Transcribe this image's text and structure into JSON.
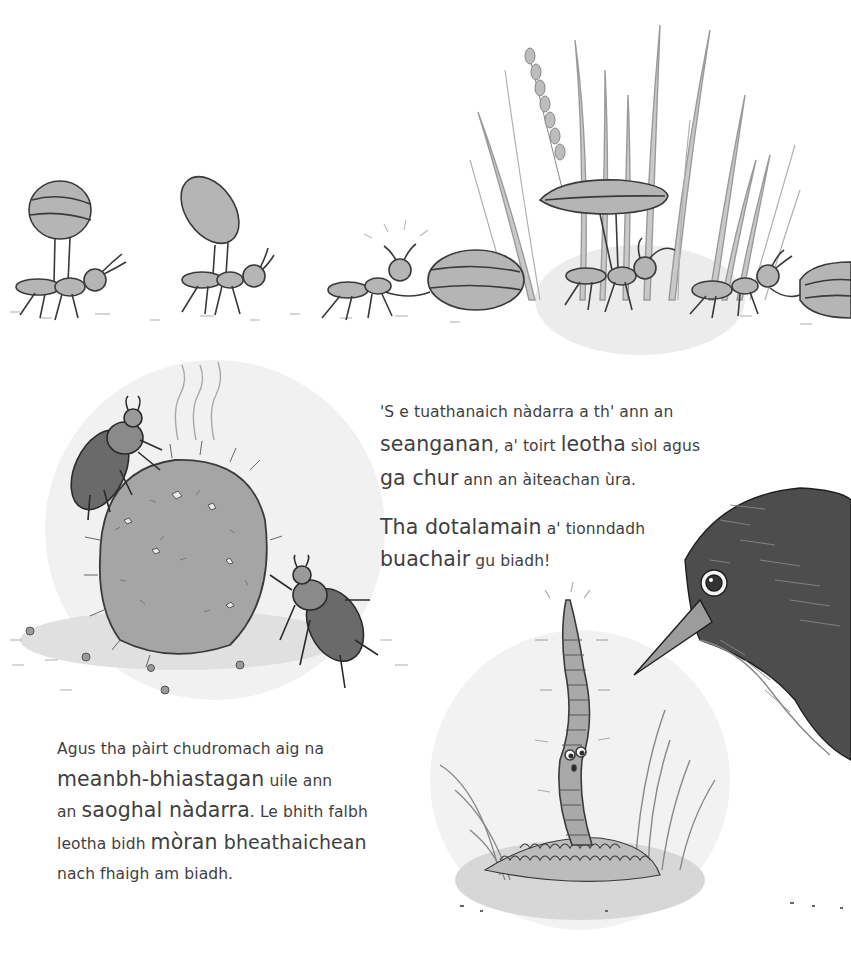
{
  "page": {
    "language": "Scottish Gaelic",
    "background": "#ffffff",
    "text_color": "#3f3f3f"
  },
  "illustrations": {
    "ants": {
      "description": "Four ants carrying and dragging striped seeds through tall grass",
      "count": 4
    },
    "dung_beetles": {
      "description": "Two dung beetles rolling a large dung ball with steam lines rising"
    },
    "worm": {
      "description": "Surprised worm rising from soil mound"
    },
    "blackbird": {
      "description": "Blackbird head with beak pointing at the worm"
    }
  },
  "paragraphs": {
    "p1": {
      "lines": [
        [
          {
            "t": "'S e tuathanaich nàdarra a th' ann an",
            "s": "sm"
          }
        ],
        [
          {
            "t": "seanganan",
            "s": "lg"
          },
          {
            "t": ", a' toirt ",
            "s": "sm"
          },
          {
            "t": "leotha",
            "s": "lg"
          },
          {
            "t": " sìol agus",
            "s": "sm"
          }
        ],
        [
          {
            "t": "ga chur",
            "s": "lg"
          },
          {
            "t": " ann an àiteachan ùra.",
            "s": "sm"
          }
        ]
      ]
    },
    "p2": {
      "lines": [
        [
          {
            "t": "Tha dotalamain",
            "s": "lg"
          },
          {
            "t": " a' tionndadh",
            "s": "sm"
          }
        ],
        [
          {
            "t": "buachair",
            "s": "lg"
          },
          {
            "t": " gu biadh!",
            "s": "sm"
          }
        ]
      ]
    },
    "p3": {
      "lines": [
        [
          {
            "t": "Agus tha pàirt chudromach aig na",
            "s": "sm"
          }
        ],
        [
          {
            "t": "meanbh-bhiastagan",
            "s": "lg"
          },
          {
            "t": " uile ann",
            "s": "sm"
          }
        ],
        [
          {
            "t": "an ",
            "s": "sm"
          },
          {
            "t": "saoghal nàdarra",
            "s": "lg"
          },
          {
            "t": ". Le bhith falbh",
            "s": "sm"
          }
        ],
        [
          {
            "t": "leotha bidh ",
            "s": "sm"
          },
          {
            "t": "mòran",
            "s": "lg"
          },
          {
            "t": " bheathaichean",
            "s": "lg"
          }
        ],
        [
          {
            "t": "nach fhaigh am biadh.",
            "s": "sm"
          }
        ]
      ]
    }
  }
}
